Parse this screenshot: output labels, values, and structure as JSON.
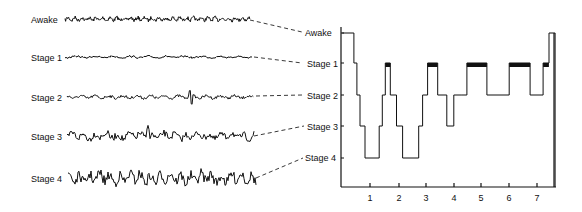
{
  "figure": {
    "eeg_traces": [
      {
        "label": "Awake",
        "amplitude": 3.2,
        "freq": "high",
        "y": 19
      },
      {
        "label": "Stage 1",
        "amplitude": 1.8,
        "freq": "medium",
        "y": 57
      },
      {
        "label": "Stage 2",
        "amplitude": 3.0,
        "freq": "medium-spindle",
        "y": 97
      },
      {
        "label": "Stage 3",
        "amplitude": 6.5,
        "freq": "low",
        "y": 136
      },
      {
        "label": "Stage 4",
        "amplitude": 10.0,
        "freq": "very-low",
        "y": 178
      }
    ],
    "hypnogram": {
      "stage_labels": [
        "Awake",
        "Stage 1",
        "Stage 2",
        "Stage 3",
        "Stage 4"
      ],
      "x_ticks": [
        "1",
        "2",
        "3",
        "4",
        "5",
        "6",
        "7"
      ]
    }
  },
  "chart_data": {
    "type": "line",
    "title": "",
    "xlabel": "Hours of sleep",
    "ylabel": "Sleep stage",
    "x_ticks": [
      1,
      2,
      3,
      4,
      5,
      6,
      7
    ],
    "xlim": [
      0,
      7.6
    ],
    "y_categories": [
      "Awake",
      "Stage 1",
      "Stage 2",
      "Stage 3",
      "Stage 4"
    ],
    "series": [
      {
        "name": "Hypnogram (stage over time, hours)",
        "steps": [
          {
            "start": 0.0,
            "end": 0.42,
            "stage": "Awake"
          },
          {
            "start": 0.42,
            "end": 0.53,
            "stage": "Stage 1"
          },
          {
            "start": 0.53,
            "end": 0.64,
            "stage": "Stage 2"
          },
          {
            "start": 0.64,
            "end": 0.82,
            "stage": "Stage 3"
          },
          {
            "start": 0.82,
            "end": 1.33,
            "stage": "Stage 4"
          },
          {
            "start": 1.33,
            "end": 1.44,
            "stage": "Stage 3"
          },
          {
            "start": 1.44,
            "end": 1.55,
            "stage": "Stage 2"
          },
          {
            "start": 1.55,
            "end": 1.73,
            "stage": "Stage 1",
            "rem": true
          },
          {
            "start": 1.73,
            "end": 1.95,
            "stage": "Stage 2"
          },
          {
            "start": 1.95,
            "end": 2.17,
            "stage": "Stage 3"
          },
          {
            "start": 2.17,
            "end": 2.75,
            "stage": "Stage 4"
          },
          {
            "start": 2.75,
            "end": 2.89,
            "stage": "Stage 3"
          },
          {
            "start": 2.89,
            "end": 3.07,
            "stage": "Stage 2"
          },
          {
            "start": 3.07,
            "end": 3.43,
            "stage": "Stage 1",
            "rem": true
          },
          {
            "start": 3.43,
            "end": 3.76,
            "stage": "Stage 2"
          },
          {
            "start": 3.76,
            "end": 4.01,
            "stage": "Stage 3"
          },
          {
            "start": 4.01,
            "end": 4.3,
            "stage": "Stage 2"
          },
          {
            "start": 4.3,
            "end": 4.48,
            "stage": "Stage 2"
          },
          {
            "start": 4.48,
            "end": 5.2,
            "stage": "Stage 1",
            "rem": true
          },
          {
            "start": 5.2,
            "end": 6.0,
            "stage": "Stage 2"
          },
          {
            "start": 6.0,
            "end": 6.75,
            "stage": "Stage 1",
            "rem": true
          },
          {
            "start": 6.75,
            "end": 7.22,
            "stage": "Stage 2"
          },
          {
            "start": 7.22,
            "end": 7.43,
            "stage": "Stage 1",
            "rem": true
          },
          {
            "start": 7.43,
            "end": 7.65,
            "stage": "Awake"
          }
        ]
      }
    ],
    "legend": "none",
    "annotations": "Black bars on Stage 1 segments mark REM sleep"
  }
}
